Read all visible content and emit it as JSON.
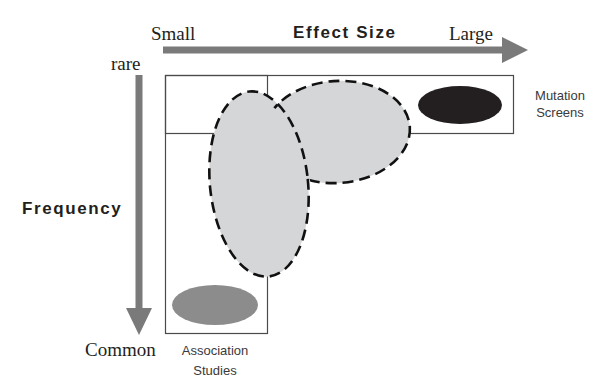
{
  "diagram": {
    "x_axis": {
      "title": "Effect Size",
      "start_label": "Small",
      "end_label": "Large",
      "arrow_color": "#7a7a7a"
    },
    "y_axis": {
      "title": "Frequency",
      "start_label": "rare",
      "end_label": "Common",
      "arrow_color": "#7a7a7a"
    },
    "regions": [
      {
        "name": "Mutation Screens",
        "line1": "Mutation",
        "line2": "Screens",
        "position": "rare / large effect",
        "fill": "#231f20"
      },
      {
        "name": "Association Studies",
        "line1": "Association",
        "line2": "Studies",
        "position": "common / small effect",
        "fill": "#8c8c8c"
      },
      {
        "name": "Gap region (dashed)",
        "position": "intermediate frequency and effect size",
        "fill": "#d4d6d7",
        "stroke": "#111111"
      }
    ],
    "frame_stroke": "#4a4a4a"
  }
}
